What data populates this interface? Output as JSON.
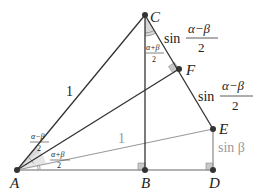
{
  "diagram": {
    "title": "",
    "colors": {
      "dark_line": "#333333",
      "light_line": "#9a9a9a",
      "point": "#333333",
      "angle_fill": "#d8d8d8",
      "right_angle_fill": "#c8c8c8",
      "gray_text": "#999999"
    },
    "points": [
      {
        "name": "A",
        "label": "A",
        "x": 17,
        "y": 170
      },
      {
        "name": "B",
        "label": "B",
        "x": 145,
        "y": 170
      },
      {
        "name": "C",
        "label": "C",
        "x": 145,
        "y": 15
      },
      {
        "name": "D",
        "label": "D",
        "x": 213,
        "y": 170
      },
      {
        "name": "E",
        "label": "E",
        "x": 213,
        "y": 129
      },
      {
        "name": "F",
        "label": "F",
        "x": 179,
        "y": 69
      }
    ],
    "segments": [
      {
        "from": "A",
        "to": "C",
        "style": "dark"
      },
      {
        "from": "C",
        "to": "B",
        "style": "dark"
      },
      {
        "from": "C",
        "to": "E",
        "style": "dark"
      },
      {
        "from": "A",
        "to": "F",
        "style": "dark"
      },
      {
        "from": "A",
        "to": "E",
        "style": "light"
      },
      {
        "from": "A",
        "to": "D",
        "style": "light"
      },
      {
        "from": "E",
        "to": "D",
        "style": "light"
      }
    ],
    "right_angles": [
      "B",
      "D",
      "F"
    ],
    "labels": {
      "AC_length": "1",
      "AE_length": "1",
      "CF_sin": "sin",
      "CF_num": "α−β",
      "CF_den": "2",
      "FE_sin": "sin",
      "FE_num": "α−β",
      "FE_den": "2",
      "ED": "sin β",
      "angle_C_num": "α+β",
      "angle_C_den": "2",
      "angle_A_upper_num": "α−β",
      "angle_A_upper_den": "2",
      "angle_A_lower_num": "α+β",
      "angle_A_lower_den": "2"
    }
  }
}
